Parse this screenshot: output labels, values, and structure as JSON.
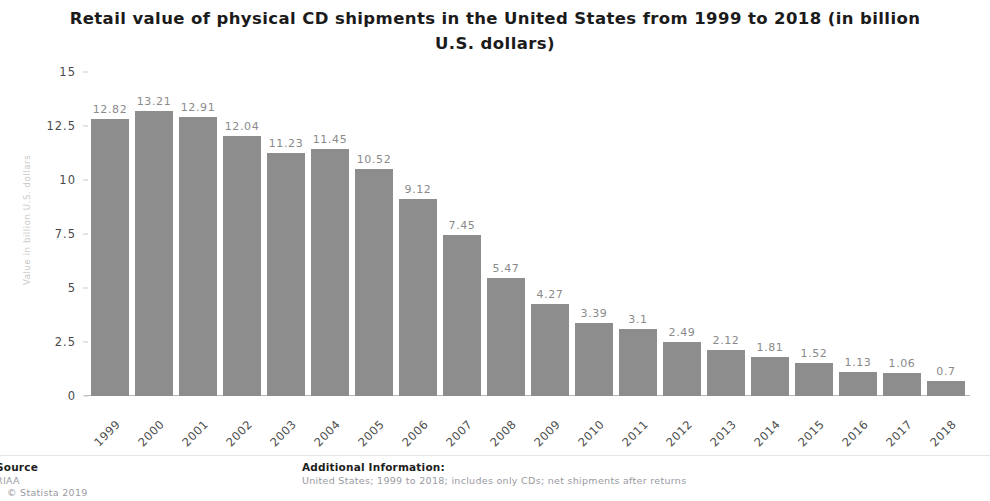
{
  "chart_data": {
    "type": "bar",
    "title": "Retail value of physical CD shipments in the United States from 1999 to 2018 (in billion U.S. dollars)",
    "xlabel": "",
    "ylabel": "Value in billion U.S. dollars",
    "ylim": [
      0,
      15
    ],
    "yticks": [
      "0",
      "2.5",
      "5",
      "7.5",
      "10",
      "12.5",
      "15"
    ],
    "ytick_values": [
      0,
      2.5,
      5,
      7.5,
      10,
      12.5,
      15
    ],
    "grid": false,
    "legend": "none",
    "bar_color": "#8d8d8d",
    "categories": [
      "1999",
      "2000",
      "2001",
      "2002",
      "2003",
      "2004",
      "2005",
      "2006",
      "2007",
      "2008",
      "2009",
      "2010",
      "2011",
      "2012",
      "2013",
      "2014",
      "2015",
      "2016",
      "2017",
      "2018"
    ],
    "values": [
      12.82,
      13.21,
      12.91,
      12.04,
      11.23,
      11.45,
      10.52,
      9.12,
      7.45,
      5.47,
      4.27,
      3.39,
      3.1,
      2.49,
      2.12,
      1.81,
      1.52,
      1.13,
      1.06,
      0.7
    ],
    "value_labels": [
      "12.82",
      "13.21",
      "12.91",
      "12.04",
      "11.23",
      "11.45",
      "10.52",
      "9.12",
      "7.45",
      "5.47",
      "4.27",
      "3.39",
      "3.1",
      "2.49",
      "2.12",
      "1.81",
      "1.52",
      "1.13",
      "1.06",
      "0.7"
    ]
  },
  "footer": {
    "source_heading": "Source",
    "source_lines": [
      "RIAA",
      "© Statista 2019"
    ],
    "additional_heading": "Additional Information:",
    "additional_lines": [
      "United States; 1999 to 2018; includes only CDs; net shipments after returns"
    ]
  }
}
